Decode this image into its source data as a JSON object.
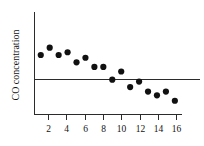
{
  "chart_data": {
    "type": "scatter",
    "title": "",
    "subtitle": "",
    "xlabel": "",
    "ylabel": "CO concentration",
    "x": [
      1,
      2,
      3,
      4,
      5,
      6,
      7,
      8,
      9,
      10,
      11,
      12,
      13,
      14,
      15,
      16
    ],
    "values": [
      2.7,
      3.5,
      2.7,
      3.0,
      1.9,
      2.4,
      1.4,
      1.4,
      0.0,
      0.9,
      -0.8,
      -0.2,
      -1.3,
      -1.7,
      -1.3,
      -2.3
    ],
    "series": [
      {
        "name": "CO concentration",
        "x": [
          1,
          2,
          3,
          4,
          5,
          6,
          7,
          8,
          9,
          10,
          11,
          12,
          13,
          14,
          15,
          16
        ],
        "values": [
          2.7,
          3.5,
          2.7,
          3.0,
          1.9,
          2.4,
          1.4,
          1.4,
          0.0,
          0.9,
          -0.8,
          -0.2,
          -1.3,
          -1.7,
          -1.3,
          -2.3
        ]
      }
    ],
    "xticks": [
      2,
      4,
      6,
      8,
      10,
      12,
      14,
      16
    ],
    "xtick_labels": [
      "2",
      "4",
      "6",
      "8",
      "10",
      "12",
      "14",
      "16"
    ],
    "yticks": [],
    "ytick_labels": [],
    "xlim": [
      0.3,
      16.8
    ],
    "ylim": [
      -3.8,
      7.4
    ],
    "grid": false,
    "legend": false,
    "legend_position": "none",
    "reference_line": {
      "name": "zero-reference-line",
      "orientation": "horizontal",
      "value": 0
    },
    "marker": {
      "shape": "circle",
      "color": "#111111",
      "size_px": 3.1
    },
    "colors": {
      "marker": "#111111",
      "axis": "#2b2b2b",
      "text": "#131313",
      "background": "#ffffff"
    }
  }
}
